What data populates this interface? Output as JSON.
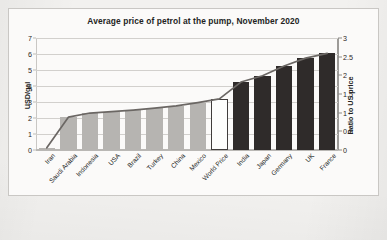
{
  "chart_data": {
    "type": "bar",
    "title": "Average price of petrol at the pump, November 2020",
    "xlabel": "",
    "ylabel": "USD/gal",
    "y2label": "Ratio to US price",
    "ylim": [
      0,
      7
    ],
    "y2lim": [
      0,
      3
    ],
    "yticks": [
      "0",
      "1",
      "2",
      "3",
      "4",
      "5",
      "6",
      "7"
    ],
    "y2ticks": [
      "0",
      "0.5",
      "1",
      "1.5",
      "2",
      "2.5",
      "3"
    ],
    "grid": true,
    "legend": "none",
    "categories": [
      "Iran",
      "Saudi Arabia",
      "Indonesia",
      "USA",
      "Brazil",
      "Turkey",
      "China",
      "Mexico",
      "World Price",
      "India",
      "Japan",
      "Germany",
      "UK",
      "France"
    ],
    "series": [
      {
        "name": "Price (USD/gal)",
        "axis": "left",
        "type": "bar",
        "values": [
          0.15,
          2.05,
          2.3,
          2.4,
          2.5,
          2.6,
          2.75,
          2.95,
          3.2,
          4.25,
          4.65,
          5.25,
          5.75,
          6.05
        ],
        "bar_styles": [
          "gray",
          "gray",
          "gray",
          "gray",
          "gray",
          "gray",
          "gray",
          "gray",
          "open",
          "dark",
          "dark",
          "dark",
          "dark",
          "dark"
        ]
      },
      {
        "name": "Ratio to US price",
        "axis": "right",
        "type": "line",
        "values": [
          0.06,
          0.88,
          0.99,
          1.03,
          1.07,
          1.12,
          1.18,
          1.27,
          1.37,
          1.82,
          1.99,
          2.25,
          2.46,
          2.59
        ]
      }
    ],
    "colors": {
      "bar_gray": "#b6b4b1",
      "bar_dark": "#2f2b2a",
      "bar_open_fill": "#fdfdfc",
      "bar_open_stroke": "#403c3b",
      "line": "#6b6764",
      "grid": "#d2d0cd",
      "text": "#231f1e",
      "frame": "#c9c7c4",
      "page": "#f2f1ef"
    }
  }
}
